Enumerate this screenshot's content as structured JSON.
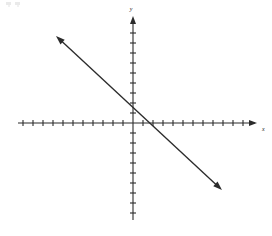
{
  "figure": {
    "kind": "coordinate-plane-line-graph",
    "width": 272,
    "height": 236,
    "background_color": "#ffffff",
    "ink_color": "#2b2b2b"
  },
  "axes": {
    "x_label": "x",
    "y_label": "y",
    "origin_px": {
      "x": 133,
      "y": 123
    },
    "unit_px": 10,
    "x_axis": {
      "start_px": 18,
      "end_px": 258,
      "arrow_at": "right",
      "tick_count": 24,
      "tick_half_length_px": 3
    },
    "y_axis": {
      "start_px": 220,
      "end_px": 16,
      "arrow_at": "top",
      "tick_count": 20,
      "tick_half_length_px": 3
    }
  },
  "artifacts": {
    "top_left_noise": "faint scan smudge"
  },
  "chart_data": {
    "type": "line",
    "title": "",
    "xlabel": "x",
    "ylabel": "y",
    "grid": false,
    "legend": null,
    "xlim": [
      -11.5,
      12.5
    ],
    "ylim": [
      -9.7,
      10.7
    ],
    "series": [
      {
        "name": "line",
        "equation": "y = -x + 1",
        "slope": -1,
        "y_intercept": 1,
        "x_intercept": 1,
        "arrow_both_ends": true,
        "endpoints": [
          {
            "x": -7.7,
            "y": 8.7
          },
          {
            "x": 8.9,
            "y": -6.7
          }
        ],
        "points": [
          {
            "x": -7.7,
            "y": 8.7
          },
          {
            "x": 0,
            "y": 1
          },
          {
            "x": 1,
            "y": 0
          },
          {
            "x": 8.9,
            "y": -6.7
          }
        ]
      }
    ]
  }
}
